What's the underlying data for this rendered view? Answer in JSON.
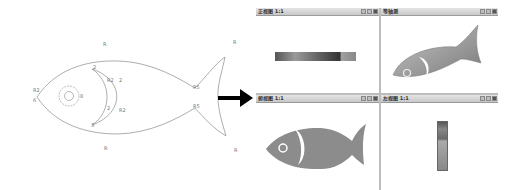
{
  "sketch": {
    "labels": [
      "R",
      "2",
      "R2",
      "2",
      "2",
      "R2",
      "3",
      "R2",
      "6",
      "8",
      "R",
      "R5",
      "R5",
      "R",
      "R"
    ],
    "line_color": "#8a8a8a"
  },
  "arrow": {
    "color": "#000000"
  },
  "viewports": [
    {
      "title": "正视图 1:1",
      "view": "top",
      "controls": [
        "minimize",
        "restore",
        "maximize"
      ]
    },
    {
      "title": "等轴测",
      "view": "isometric",
      "controls": [
        "minimize",
        "restore",
        "maximize"
      ]
    },
    {
      "title": "俯视图 1:1",
      "view": "front",
      "controls": [
        "minimize",
        "restore",
        "maximize"
      ]
    },
    {
      "title": "左视图 1:1",
      "view": "side",
      "controls": [
        "minimize",
        "restore",
        "maximize"
      ]
    }
  ],
  "colors": {
    "fish_fill": "#8c8c8c",
    "fish_light": "#c4c4c4",
    "titlebar": "#d0d0d0",
    "divider": "#bdbdbd"
  }
}
